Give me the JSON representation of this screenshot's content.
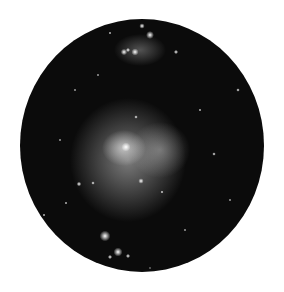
{
  "image": {
    "subject": "Orion Nebula (M42) and Running Man Nebula viewed through circular eyepiece field",
    "background_color": "#ffffff",
    "field_color": "#0b0b0b",
    "field": {
      "cx": 142,
      "cy": 145,
      "rx": 122,
      "ry": 126.5
    }
  },
  "nebulae": [
    {
      "name": "main-nebula-glow",
      "cx": 128,
      "cy": 160,
      "rx": 58,
      "ry": 62,
      "opacity": 0.55
    },
    {
      "name": "nebula-core",
      "cx": 124,
      "cy": 148,
      "rx": 22,
      "ry": 18,
      "opacity": 0.8
    },
    {
      "name": "upper-nebula",
      "cx": 140,
      "cy": 50,
      "rx": 26,
      "ry": 16,
      "opacity": 0.35
    },
    {
      "name": "nebula-right-lobe",
      "cx": 160,
      "cy": 150,
      "rx": 30,
      "ry": 28,
      "opacity": 0.4
    }
  ],
  "stars": [
    {
      "x": 142,
      "y": 26,
      "r": 1.5
    },
    {
      "x": 150,
      "y": 35,
      "r": 2.2
    },
    {
      "x": 124,
      "y": 52,
      "r": 1.8
    },
    {
      "x": 135,
      "y": 52,
      "r": 2
    },
    {
      "x": 128,
      "y": 50,
      "r": 1.2
    },
    {
      "x": 176,
      "y": 52,
      "r": 1.2
    },
    {
      "x": 110,
      "y": 33,
      "r": 0.8
    },
    {
      "x": 238,
      "y": 90,
      "r": 1
    },
    {
      "x": 136,
      "y": 117,
      "r": 1
    },
    {
      "x": 126,
      "y": 147,
      "r": 2.5
    },
    {
      "x": 141,
      "y": 181,
      "r": 1.5
    },
    {
      "x": 79,
      "y": 184,
      "r": 1.3
    },
    {
      "x": 105,
      "y": 236,
      "r": 3
    },
    {
      "x": 118,
      "y": 252,
      "r": 2.5
    },
    {
      "x": 110,
      "y": 257,
      "r": 1.2
    },
    {
      "x": 128,
      "y": 256,
      "r": 1.2
    },
    {
      "x": 214,
      "y": 154,
      "r": 1
    },
    {
      "x": 93,
      "y": 183,
      "r": 1
    },
    {
      "x": 162,
      "y": 192,
      "r": 0.9
    },
    {
      "x": 44,
      "y": 215,
      "r": 0.8
    },
    {
      "x": 66,
      "y": 203,
      "r": 0.8
    },
    {
      "x": 200,
      "y": 110,
      "r": 0.8
    },
    {
      "x": 75,
      "y": 90,
      "r": 0.7
    },
    {
      "x": 60,
      "y": 140,
      "r": 0.7
    },
    {
      "x": 230,
      "y": 200,
      "r": 0.7
    },
    {
      "x": 185,
      "y": 230,
      "r": 0.7
    },
    {
      "x": 150,
      "y": 268,
      "r": 0.6
    },
    {
      "x": 98,
      "y": 75,
      "r": 0.7
    }
  ]
}
